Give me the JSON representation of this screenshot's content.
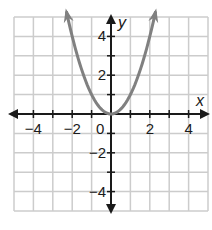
{
  "chart_data": {
    "type": "line",
    "title": "",
    "function": "y = x^2",
    "xlabel": "x",
    "ylabel": "y",
    "xlim": [
      -5,
      5
    ],
    "ylim": [
      -5,
      5
    ],
    "grid": true,
    "grid_step": 1,
    "x_ticks": [
      "-4",
      "-2",
      "0",
      "2",
      "4"
    ],
    "y_ticks": [
      "4",
      "2",
      "-2",
      "-4"
    ],
    "series": [
      {
        "name": "parabola",
        "color": "#808080",
        "x": [
          -2.3,
          -2,
          -1.5,
          -1,
          -0.5,
          0,
          0.5,
          1,
          1.5,
          2,
          2.3
        ],
        "y": [
          5.29,
          4,
          2.25,
          1,
          0.25,
          0,
          0.25,
          1,
          2.25,
          4,
          5.29
        ],
        "arrows_both_ends": true
      }
    ],
    "colors": {
      "grid": "#cccccc",
      "axes": "#1a1a1a",
      "curve": "#808080"
    }
  },
  "labels": {
    "x_axis": "x",
    "y_axis": "y",
    "origin": "0",
    "x_ticks": [
      {
        "text": "−4",
        "v": -4
      },
      {
        "text": "−2",
        "v": -2
      },
      {
        "text": "2",
        "v": 2
      },
      {
        "text": "4",
        "v": 4
      }
    ],
    "y_ticks": [
      {
        "text": "4",
        "v": 4
      },
      {
        "text": "2",
        "v": 2
      },
      {
        "text": "−2",
        "v": -2
      },
      {
        "text": "−4",
        "v": -4
      }
    ]
  }
}
